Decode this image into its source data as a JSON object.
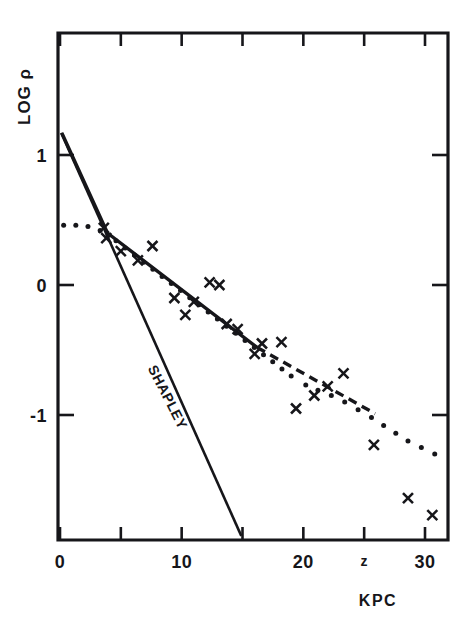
{
  "figure": {
    "caption_absent": true,
    "background_color": "#ffffff",
    "ink_color": "#16161a"
  },
  "chart_data": {
    "type": "scatter",
    "title": "",
    "subtitle": "",
    "xlabel": "KPC",
    "ylabel": "LOG ρ",
    "xlim": [
      -0.5,
      32
    ],
    "ylim": [
      -1.95,
      1.35
    ],
    "grid": false,
    "legend": "none",
    "x_ticks": [
      {
        "value": 0,
        "label": "0"
      },
      {
        "value": 5,
        "label": ""
      },
      {
        "value": 10,
        "label": "10"
      },
      {
        "value": 15,
        "label": ""
      },
      {
        "value": 20,
        "label": "20"
      },
      {
        "value": 25,
        "label": "z"
      },
      {
        "value": 30,
        "label": "30"
      }
    ],
    "y_ticks": [
      {
        "value": 1,
        "label": "1"
      },
      {
        "value": 0,
        "label": "0"
      },
      {
        "value": -1,
        "label": "-1"
      }
    ],
    "annotations": [
      {
        "text": "SHAPLEY",
        "x": 8.5,
        "y": -0.88,
        "rotation": 63
      }
    ],
    "series": [
      {
        "name": "observed-points",
        "type": "scatter",
        "marker": "x",
        "points": [
          {
            "x": 3.6,
            "y": 0.44
          },
          {
            "x": 3.8,
            "y": 0.36
          },
          {
            "x": 5.0,
            "y": 0.26
          },
          {
            "x": 6.4,
            "y": 0.19
          },
          {
            "x": 7.6,
            "y": 0.3
          },
          {
            "x": 9.4,
            "y": -0.1
          },
          {
            "x": 10.3,
            "y": -0.23
          },
          {
            "x": 11.0,
            "y": -0.13
          },
          {
            "x": 12.3,
            "y": 0.02
          },
          {
            "x": 13.1,
            "y": 0.0
          },
          {
            "x": 13.7,
            "y": -0.3
          },
          {
            "x": 14.6,
            "y": -0.34
          },
          {
            "x": 16.0,
            "y": -0.53
          },
          {
            "x": 16.6,
            "y": -0.45
          },
          {
            "x": 18.2,
            "y": -0.44
          },
          {
            "x": 19.4,
            "y": -0.95
          },
          {
            "x": 20.9,
            "y": -0.85
          },
          {
            "x": 22.0,
            "y": -0.78
          },
          {
            "x": 23.3,
            "y": -0.68
          },
          {
            "x": 25.8,
            "y": -1.23
          },
          {
            "x": 28.6,
            "y": -1.64
          },
          {
            "x": 30.6,
            "y": -1.77
          }
        ]
      },
      {
        "name": "shapley-model-line",
        "type": "line",
        "style": "solid",
        "label": "SHAPLEY",
        "points": [
          {
            "x": 0.1,
            "y": 1.17
          },
          {
            "x": 14.9,
            "y": -1.93
          }
        ]
      },
      {
        "name": "fitted-line-solid",
        "type": "line",
        "style": "solid",
        "points": [
          {
            "x": 0.15,
            "y": 1.17
          },
          {
            "x": 3.9,
            "y": 0.4
          },
          {
            "x": 16.2,
            "y": -0.48
          }
        ]
      },
      {
        "name": "fitted-line-dashed",
        "type": "line",
        "style": "dashed",
        "points": [
          {
            "x": 16.2,
            "y": -0.48
          },
          {
            "x": 25.9,
            "y": -0.99
          }
        ]
      },
      {
        "name": "model-dotted-curve",
        "type": "line",
        "style": "dotted",
        "points": [
          {
            "x": 0.3,
            "y": 0.46
          },
          {
            "x": 1.3,
            "y": 0.46
          },
          {
            "x": 2.3,
            "y": 0.45
          },
          {
            "x": 3.3,
            "y": 0.42
          },
          {
            "x": 4.6,
            "y": 0.34
          },
          {
            "x": 19.0,
            "y": -0.7
          },
          {
            "x": 20.2,
            "y": -0.77
          },
          {
            "x": 21.2,
            "y": -0.81
          },
          {
            "x": 22.3,
            "y": -0.85
          },
          {
            "x": 23.4,
            "y": -0.9
          },
          {
            "x": 24.5,
            "y": -0.96
          },
          {
            "x": 25.6,
            "y": -1.02
          },
          {
            "x": 26.6,
            "y": -1.08
          },
          {
            "x": 27.6,
            "y": -1.14
          },
          {
            "x": 28.6,
            "y": -1.2
          },
          {
            "x": 29.7,
            "y": -1.25
          },
          {
            "x": 30.8,
            "y": -1.3
          }
        ]
      }
    ]
  },
  "axes": {
    "y_axis_title": "LOG ρ",
    "x_axis_title": "KPC",
    "y_tick_labels": [
      "1",
      "0",
      "-1"
    ],
    "x_tick_labels": [
      "0",
      "10",
      "20",
      "z",
      "30"
    ]
  },
  "labels": {
    "shapley": "SHAPLEY"
  }
}
